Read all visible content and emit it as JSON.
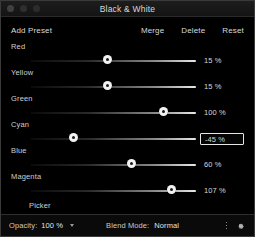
{
  "window": {
    "title": "Black & White",
    "traffic_lights": [
      "close-dot",
      "minimize-dot",
      "zoom-dot"
    ]
  },
  "header": {
    "add_preset_label": "Add Preset",
    "actions": [
      {
        "label": "Merge",
        "name": "merge-button"
      },
      {
        "label": "Delete",
        "name": "delete-button"
      },
      {
        "label": "Reset",
        "name": "reset-button"
      }
    ]
  },
  "sliders": [
    {
      "label": "Red",
      "value": "15 %",
      "percent": 15,
      "knob": 36,
      "focused": false
    },
    {
      "label": "Yellow",
      "value": "15 %",
      "percent": 15,
      "knob": 36,
      "focused": false
    },
    {
      "label": "Green",
      "value": "100 %",
      "percent": 100,
      "knob": 62,
      "focused": false
    },
    {
      "label": "Cyan",
      "value": "-45 %",
      "percent": -45,
      "knob": 20,
      "focused": true
    },
    {
      "label": "Blue",
      "value": "60 %",
      "percent": 60,
      "knob": 47,
      "focused": false
    },
    {
      "label": "Magenta",
      "value": "107 %",
      "percent": 107,
      "knob": 66,
      "focused": false
    }
  ],
  "picker": {
    "label": "Picker"
  },
  "bottom_bar": {
    "opacity_label": "Opacity:",
    "opacity_value": "100 %",
    "blend_mode_label": "Blend Mode:",
    "blend_mode_value": "Normal",
    "overflow_icon": "more-options-icon",
    "settings_icon": "gear-icon"
  },
  "colors": {
    "background": "#000000",
    "text": "#d8d8d8",
    "knob": "#f2f2f2",
    "focus_border": "#e6e6e6"
  }
}
